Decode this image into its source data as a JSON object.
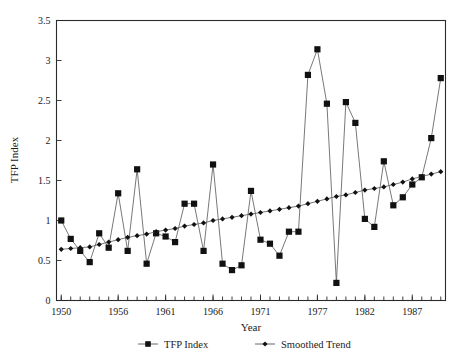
{
  "chart_data": {
    "type": "line",
    "title": "",
    "xlabel": "Year",
    "ylabel": "TFP Index",
    "xlim": [
      1949.5,
      1990.5
    ],
    "ylim": [
      0,
      3.5
    ],
    "yticks": [
      0,
      0.5,
      1,
      1.5,
      2,
      2.5,
      3,
      3.5
    ],
    "ytick_labels": [
      "0",
      "0.5",
      "1",
      "1.5",
      "2",
      "2.5",
      "3",
      "3.5"
    ],
    "xticks": [
      1950,
      1956,
      1961,
      1966,
      1971,
      1977,
      1982,
      1987
    ],
    "xtick_labels": [
      "1950",
      "1956",
      "1961",
      "1966",
      "1971",
      "1977",
      "1982",
      "1987"
    ],
    "xtick_minor_step": 1,
    "grid": false,
    "legend_position": "bottom",
    "x": [
      1950,
      1951,
      1952,
      1953,
      1954,
      1955,
      1956,
      1957,
      1958,
      1959,
      1960,
      1961,
      1962,
      1963,
      1964,
      1965,
      1966,
      1967,
      1968,
      1969,
      1970,
      1971,
      1972,
      1973,
      1974,
      1975,
      1976,
      1977,
      1978,
      1979,
      1980,
      1981,
      1982,
      1983,
      1984,
      1985,
      1986,
      1987,
      1988,
      1989,
      1990
    ],
    "series": [
      {
        "name": "TFP Index",
        "marker": "square",
        "values": [
          1.0,
          0.77,
          0.62,
          0.48,
          0.84,
          0.66,
          1.34,
          0.62,
          1.64,
          0.46,
          0.84,
          0.8,
          0.73,
          1.21,
          1.21,
          0.62,
          1.7,
          0.46,
          0.38,
          0.44,
          1.37,
          0.76,
          0.71,
          0.56,
          0.86,
          0.86,
          2.82,
          3.14,
          2.46,
          0.22,
          2.48,
          2.22,
          1.02,
          0.92,
          1.74,
          1.19,
          1.29,
          1.45,
          1.54,
          2.03,
          2.78
        ]
      },
      {
        "name": "Smoothed Trend",
        "marker": "diamond",
        "values": [
          0.64,
          0.65,
          0.66,
          0.67,
          0.7,
          0.73,
          0.76,
          0.79,
          0.81,
          0.83,
          0.86,
          0.88,
          0.9,
          0.93,
          0.95,
          0.97,
          1.0,
          1.02,
          1.04,
          1.06,
          1.08,
          1.1,
          1.12,
          1.14,
          1.16,
          1.18,
          1.21,
          1.24,
          1.27,
          1.3,
          1.32,
          1.35,
          1.38,
          1.4,
          1.42,
          1.45,
          1.48,
          1.52,
          1.55,
          1.58,
          1.61
        ]
      }
    ],
    "legend": [
      {
        "label": "TFP Index",
        "marker": "square"
      },
      {
        "label": "Smoothed Trend",
        "marker": "diamond"
      }
    ],
    "colors": {
      "line": "#555555",
      "marker": "#111111",
      "frame": "#2b2b2b",
      "background": "#ffffff"
    }
  }
}
